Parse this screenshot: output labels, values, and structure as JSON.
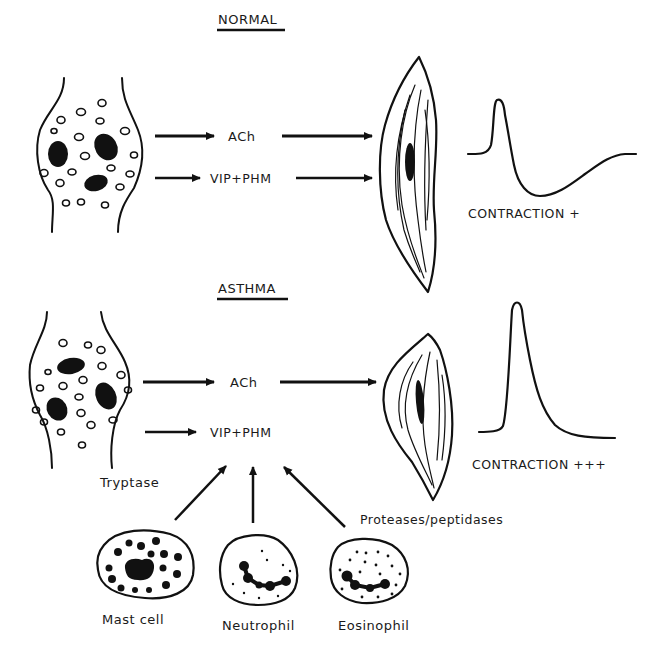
{
  "colors": {
    "ink": "#111111",
    "background": "#ffffff"
  },
  "panels": {
    "normal": {
      "title": "NORMAL",
      "mediators": [
        "ACh",
        "VIP+PHM"
      ],
      "response": "CONTRACTION +"
    },
    "asthma": {
      "title": "ASTHMA",
      "mediators": [
        "ACh",
        "VIP+PHM"
      ],
      "response": "CONTRACTION +++",
      "enzyme_labels": {
        "tryptase": "Tryptase",
        "proteases": "Proteases/peptidases"
      },
      "cells": [
        "Mast cell",
        "Neutrophil",
        "Eosinophil"
      ]
    }
  },
  "icons": {
    "nerve_terminal": "nerve-terminal-icon",
    "smooth_muscle": "smooth-muscle-cell-icon",
    "trace": "contraction-trace-icon",
    "mast_cell": "mast-cell-icon",
    "neutrophil": "neutrophil-icon",
    "eosinophil": "eosinophil-icon"
  }
}
